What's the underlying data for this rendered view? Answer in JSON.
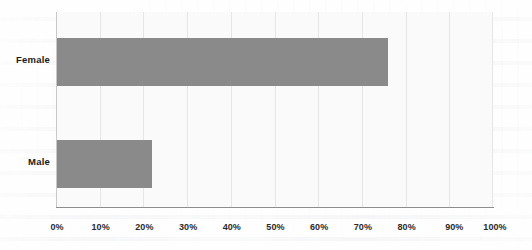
{
  "chart_data": {
    "type": "bar",
    "orientation": "horizontal",
    "title": "",
    "subtitle": "",
    "xlabel": "",
    "ylabel": "",
    "categories": [
      "Female",
      "Male"
    ],
    "values": [
      76,
      22
    ],
    "value_suffix": "%",
    "xlim": [
      0,
      100
    ],
    "xticks": [
      0,
      10,
      20,
      30,
      40,
      50,
      60,
      70,
      80,
      90,
      100
    ],
    "xtick_labels": [
      "0%",
      "10%",
      "20%",
      "30%",
      "40%",
      "50%",
      "60%",
      "70%",
      "80%",
      "90%",
      "100%"
    ],
    "grid": true,
    "grid_axis": "x",
    "legend": false,
    "legend_position": "none",
    "series": [
      {
        "name": "",
        "values": [
          76,
          22
        ],
        "color": "#8a8a8a"
      }
    ]
  },
  "style": {
    "bar_color": "#8a8a8a",
    "plot_background": "#fafafa",
    "page_background": "#fefefe",
    "gridline_color": "#e6e6e6",
    "axis_color": "#8d8d8d",
    "label_color": "#1a1a1a",
    "tick_color": "#2b2b2b"
  }
}
